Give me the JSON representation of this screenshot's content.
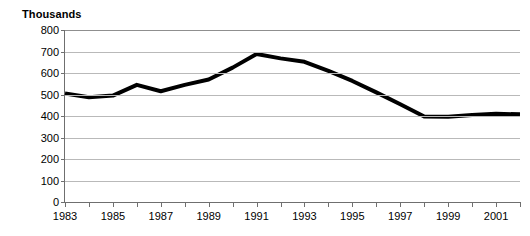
{
  "chart_data": {
    "type": "line",
    "title": "",
    "axis_note": "Thousands",
    "xlabel": "",
    "ylabel": "Thousands",
    "ylim": [
      0,
      800
    ],
    "ytick_step": 100,
    "ytick_labels": [
      "800",
      "700",
      "600",
      "500",
      "400",
      "300",
      "200",
      "100",
      "0"
    ],
    "ytick_values": [
      800,
      700,
      600,
      500,
      400,
      300,
      200,
      100,
      0
    ],
    "xlim": [
      1983,
      2002
    ],
    "xtick_values": [
      1983,
      1984,
      1985,
      1986,
      1987,
      1988,
      1989,
      1990,
      1991,
      1992,
      1993,
      1994,
      1995,
      1996,
      1997,
      1998,
      1999,
      2000,
      2001,
      2002
    ],
    "xtick_labels": [
      "1983",
      "",
      "1985",
      "",
      "1987",
      "",
      "1989",
      "",
      "1991",
      "",
      "1993",
      "",
      "1995",
      "",
      "1997",
      "",
      "1999",
      "",
      "2001",
      ""
    ],
    "x": [
      1983,
      1984,
      1985,
      1986,
      1987,
      1988,
      1989,
      1990,
      1991,
      1992,
      1993,
      1994,
      1995,
      1996,
      1997,
      1998,
      1999,
      2000,
      2001,
      2002
    ],
    "values": [
      505,
      487,
      495,
      545,
      515,
      545,
      570,
      625,
      688,
      668,
      652,
      610,
      563,
      510,
      455,
      398,
      397,
      405,
      410,
      408
    ],
    "series": [
      {
        "name": "",
        "color": "#000000",
        "line_width": 4,
        "values": [
          505,
          487,
          495,
          545,
          515,
          545,
          570,
          625,
          688,
          668,
          652,
          610,
          563,
          510,
          455,
          398,
          397,
          405,
          410,
          408
        ]
      }
    ],
    "grid": true,
    "grid_color": "#b9b9b9",
    "legend": "none",
    "background": "#ffffff"
  }
}
